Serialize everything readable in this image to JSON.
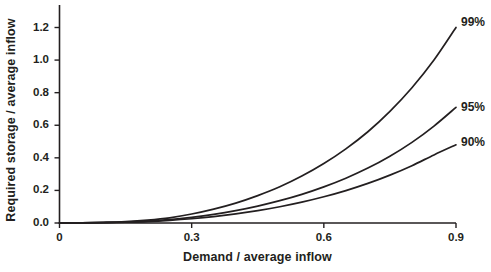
{
  "chart_data": {
    "type": "line",
    "title": "",
    "xlabel": "Demand / average inflow",
    "ylabel": "Required storage / average inflow",
    "xlim": [
      0,
      0.9
    ],
    "ylim": [
      0,
      1.3
    ],
    "xticks": [
      "0",
      "0.3",
      "0.6",
      "0.9"
    ],
    "xtick_values": [
      0,
      0.3,
      0.6,
      0.9
    ],
    "yticks": [
      "0.0",
      "0.2",
      "0.4",
      "0.6",
      "0.8",
      "1.0",
      "1.2"
    ],
    "ytick_values": [
      0.0,
      0.2,
      0.4,
      0.6,
      0.8,
      1.0,
      1.2
    ],
    "grid": false,
    "legend_position": "right-inline",
    "line_color": "#231f20",
    "x": [
      0.0,
      0.05,
      0.1,
      0.15,
      0.2,
      0.25,
      0.3,
      0.35,
      0.4,
      0.45,
      0.5,
      0.55,
      0.6,
      0.65,
      0.7,
      0.75,
      0.8,
      0.85,
      0.9
    ],
    "series": [
      {
        "name": "99%",
        "label": "99%",
        "values": [
          0.0,
          0.001,
          0.004,
          0.009,
          0.018,
          0.032,
          0.055,
          0.085,
          0.122,
          0.168,
          0.222,
          0.288,
          0.365,
          0.455,
          0.56,
          0.685,
          0.83,
          1.0,
          1.2
        ]
      },
      {
        "name": "95%",
        "label": "95%",
        "values": [
          0.0,
          0.001,
          0.003,
          0.006,
          0.012,
          0.021,
          0.035,
          0.053,
          0.076,
          0.104,
          0.137,
          0.176,
          0.222,
          0.275,
          0.337,
          0.41,
          0.495,
          0.595,
          0.71
        ]
      },
      {
        "name": "90%",
        "label": "90%",
        "values": [
          0.0,
          0.0005,
          0.002,
          0.005,
          0.009,
          0.016,
          0.026,
          0.039,
          0.056,
          0.076,
          0.1,
          0.128,
          0.161,
          0.199,
          0.243,
          0.294,
          0.352,
          0.418,
          0.48
        ]
      }
    ]
  },
  "axes": {
    "x_title": "Demand / average inflow",
    "y_title": "Required storage / average inflow"
  },
  "labels": {
    "series_99": "99%",
    "series_95": "95%",
    "series_90": "90%"
  }
}
